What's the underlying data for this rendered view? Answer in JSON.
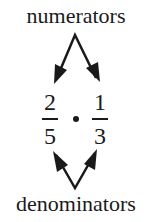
{
  "labels": {
    "top": "numerators",
    "bottom": "denominators"
  },
  "expression": {
    "operator": "multiply-dot",
    "fractions": [
      {
        "numerator": "2",
        "denominator": "5"
      },
      {
        "numerator": "1",
        "denominator": "3"
      }
    ]
  },
  "colors": {
    "ink": "#1a1a1a",
    "background": "#ffffff"
  }
}
